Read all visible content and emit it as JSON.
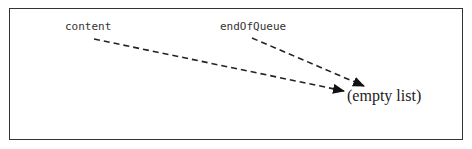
{
  "diagram": {
    "labels": {
      "content": "content",
      "end_of_queue": "endOfQueue",
      "target": "(empty list)"
    },
    "arrows": [
      {
        "from": "content",
        "to": "(empty list)",
        "style": "dashed"
      },
      {
        "from": "endOfQueue",
        "to": "(empty list)",
        "style": "dashed"
      }
    ]
  }
}
